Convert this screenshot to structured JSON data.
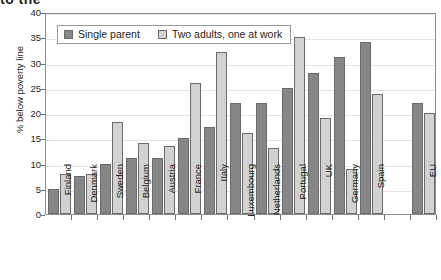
{
  "title_fragment": "to the",
  "chart_data": {
    "type": "bar",
    "title": "",
    "xlabel": "",
    "ylabel": "% below poverty line",
    "ylim": [
      0,
      40
    ],
    "yticks": [
      0,
      5,
      10,
      15,
      20,
      25,
      30,
      35,
      40
    ],
    "grid": true,
    "legend_position": "top-left",
    "categories": [
      "Finland",
      "Denmark",
      "Sweden",
      "Belgium",
      "Austria",
      "France",
      "Italy",
      "Luxembourg",
      "Netherlands",
      "Portugal",
      "UK",
      "Germany",
      "Spain",
      "",
      "EU"
    ],
    "series": [
      {
        "name": "Single parent",
        "color": "#868686",
        "values": [
          5,
          7.5,
          10,
          11,
          11,
          15,
          17.3,
          22,
          22,
          25,
          28,
          31,
          34,
          null,
          22
        ]
      },
      {
        "name": "Two adults, one at work",
        "color": "#d2d2d2",
        "values": [
          8,
          8,
          18.3,
          14,
          13.5,
          26,
          32,
          16,
          13,
          35,
          19,
          9,
          23.8,
          null,
          20
        ]
      }
    ]
  },
  "legend": {
    "items": [
      {
        "label": "Single parent",
        "swatch": "single"
      },
      {
        "label": "Two adults, one at work",
        "swatch": "two"
      }
    ]
  }
}
